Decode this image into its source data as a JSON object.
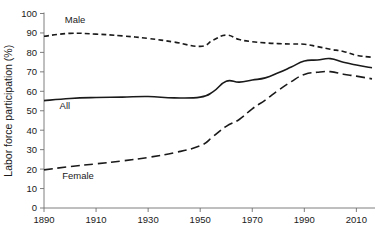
{
  "chart_data": {
    "type": "line",
    "title": "",
    "subtitle": "",
    "xlabel": "",
    "ylabel": "Labor force participation (%)",
    "xlim": [
      1890,
      2016
    ],
    "ylim": [
      0,
      100
    ],
    "xticks": [
      1890,
      1910,
      1930,
      1950,
      1970,
      1990,
      2010
    ],
    "xtick_labels": [
      "1890",
      "1910",
      "1930",
      "1950",
      "1970",
      "1990",
      "2010"
    ],
    "yticks": [
      0,
      10,
      20,
      30,
      40,
      50,
      60,
      70,
      80,
      90,
      100
    ],
    "ytick_labels": [
      "0",
      "10",
      "20",
      "30",
      "40",
      "50",
      "60",
      "70",
      "80",
      "90",
      "100"
    ],
    "grid": false,
    "legend": "inline-annotations",
    "x": [
      1890,
      1900,
      1910,
      1920,
      1930,
      1940,
      1950,
      1955,
      1960,
      1965,
      1970,
      1975,
      1980,
      1985,
      1990,
      1995,
      2000,
      2005,
      2010,
      2016
    ],
    "series": [
      {
        "name": "Male",
        "label": "Male",
        "style": "short-dashed",
        "color": "#1a1a1a",
        "values": [
          88.3,
          89.8,
          89.4,
          88.5,
          87.2,
          85.3,
          83.1,
          86.3,
          88.9,
          86.6,
          85.5,
          84.9,
          84.5,
          84.3,
          84.2,
          83.0,
          81.6,
          80.5,
          78.5,
          77.5
        ]
      },
      {
        "name": "All",
        "label": "All",
        "style": "solid",
        "color": "#1a1a1a",
        "values": [
          55.2,
          56.3,
          56.8,
          57.0,
          57.3,
          56.6,
          57.0,
          59.8,
          65.2,
          64.7,
          65.8,
          66.9,
          69.5,
          72.5,
          75.6,
          76.1,
          76.8,
          74.9,
          73.5,
          72.1
        ]
      },
      {
        "name": "Female",
        "label": "Female",
        "style": "long-dashed",
        "color": "#1a1a1a",
        "values": [
          19.6,
          21.3,
          22.7,
          24.2,
          26.0,
          28.4,
          32.0,
          36.8,
          42.0,
          45.5,
          51.0,
          55.5,
          60.5,
          65.0,
          68.7,
          69.8,
          70.1,
          68.8,
          67.8,
          66.4
        ]
      }
    ],
    "annotations": [
      {
        "name": "male-label",
        "text": "Male",
        "x": 1898,
        "y": 95
      },
      {
        "name": "all-label",
        "text": "All",
        "x": 1896,
        "y": 51
      },
      {
        "name": "female-label",
        "text": "Female",
        "x": 1897,
        "y": 15
      }
    ]
  }
}
